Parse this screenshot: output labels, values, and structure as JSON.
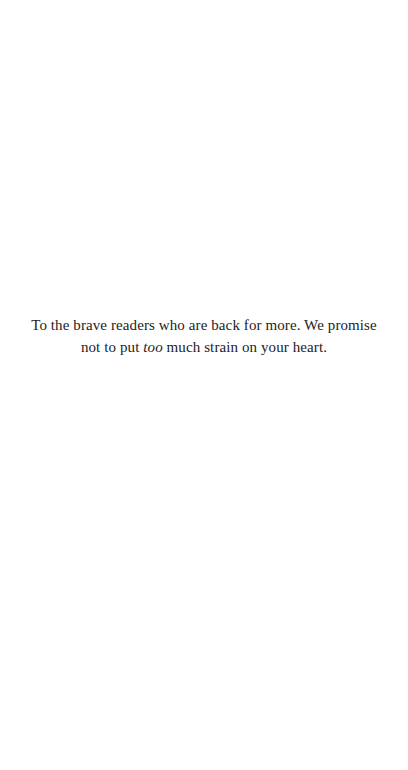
{
  "dedication": {
    "line1": "To the brave readers who are back for more. We promise",
    "line2_before": "not to put ",
    "line2_italic": "too",
    "line2_after": " much strain on your heart."
  }
}
